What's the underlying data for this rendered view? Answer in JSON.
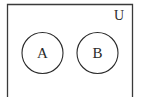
{
  "diagram": {
    "type": "venn",
    "universe": {
      "label": "U",
      "stroke": "#3a3a3a"
    },
    "sets": [
      {
        "label": "A",
        "stroke": "#2a2a2a"
      },
      {
        "label": "B",
        "stroke": "#2a2a2a"
      }
    ],
    "relationship": "disjoint"
  }
}
